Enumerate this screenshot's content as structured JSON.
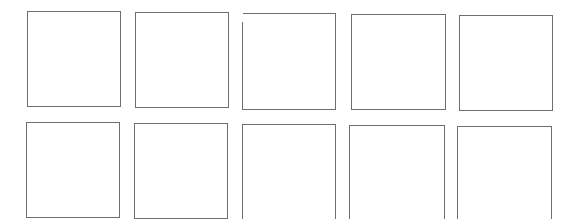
{
  "grid": {
    "rows": 2,
    "columns": 5,
    "border_color": "#6e6e6e",
    "background": "#ffffff",
    "boxes": [
      {
        "row": 1,
        "col": 1,
        "x": 27,
        "y": 11,
        "w": 94,
        "h": 96,
        "content": ""
      },
      {
        "row": 1,
        "col": 2,
        "x": 135,
        "y": 12,
        "w": 94,
        "h": 96,
        "content": ""
      },
      {
        "row": 1,
        "col": 3,
        "x": 243,
        "y": 13,
        "w": 93,
        "h": 97,
        "content": ""
      },
      {
        "row": 1,
        "col": 4,
        "x": 351,
        "y": 14,
        "w": 95,
        "h": 96,
        "content": ""
      },
      {
        "row": 1,
        "col": 5,
        "x": 459,
        "y": 15,
        "w": 94,
        "h": 96,
        "content": ""
      },
      {
        "row": 2,
        "col": 1,
        "x": 26,
        "y": 122,
        "w": 94,
        "h": 96,
        "content": ""
      },
      {
        "row": 2,
        "col": 2,
        "x": 134,
        "y": 123,
        "w": 94,
        "h": 96,
        "content": ""
      },
      {
        "row": 2,
        "col": 3,
        "x": 242,
        "y": 124,
        "w": 94,
        "h": 96,
        "content": ""
      },
      {
        "row": 2,
        "col": 4,
        "x": 349,
        "y": 125,
        "w": 96,
        "h": 95,
        "content": ""
      },
      {
        "row": 2,
        "col": 5,
        "x": 457,
        "y": 126,
        "w": 95,
        "h": 94,
        "content": ""
      }
    ]
  }
}
